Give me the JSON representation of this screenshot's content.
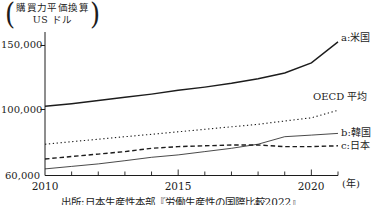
{
  "y_axis_title": {
    "open_paren": "(",
    "line1": "購買力平価換算",
    "line2": "US ドル",
    "close_paren": ")"
  },
  "y_axis": {
    "ticks": [
      {
        "label": "150,000",
        "value": 150000
      },
      {
        "label": "100,000",
        "value": 100000
      },
      {
        "label": "60,000",
        "value": 60000
      }
    ]
  },
  "x_axis": {
    "labels": [
      "2010",
      "2015",
      "2020"
    ],
    "unit": "(年)"
  },
  "caption": "出所:日本生産性本部『労働生産性の国際比較2022』",
  "chart_data": {
    "type": "line",
    "x": [
      2010,
      2011,
      2012,
      2013,
      2014,
      2015,
      2016,
      2017,
      2018,
      2019,
      2020,
      2021
    ],
    "x_tick_labels": [
      "2010",
      "2015",
      "2020"
    ],
    "xlabel": "(年)",
    "ylabel": "購買力平価換算 US ドル",
    "ylim": [
      60000,
      155000
    ],
    "y_ticks": [
      60000,
      100000,
      150000
    ],
    "grid": false,
    "legend_position": "right-annotations",
    "line_color": "#1c1c1c",
    "series": [
      {
        "name": "a:米国",
        "style": "solid",
        "values": [
          102500,
          104500,
          107000,
          109500,
          112000,
          115000,
          117500,
          120500,
          124000,
          128500,
          136500,
          152800
        ]
      },
      {
        "name": "OECD 平均",
        "style": "dotted",
        "values": [
          79000,
          80500,
          82000,
          83500,
          85000,
          86500,
          88000,
          89500,
          91000,
          93000,
          95000,
          99500
        ]
      },
      {
        "name": "b:韓国",
        "style": "thin-solid",
        "values": [
          64000,
          65500,
          67000,
          69000,
          71000,
          72500,
          74500,
          76500,
          79000,
          83500,
          84500,
          85500
        ]
      },
      {
        "name": "c:日本",
        "style": "dashed",
        "values": [
          70000,
          71500,
          73000,
          74500,
          76500,
          77500,
          78000,
          78500,
          78500,
          77500,
          77500,
          78000
        ]
      }
    ]
  }
}
